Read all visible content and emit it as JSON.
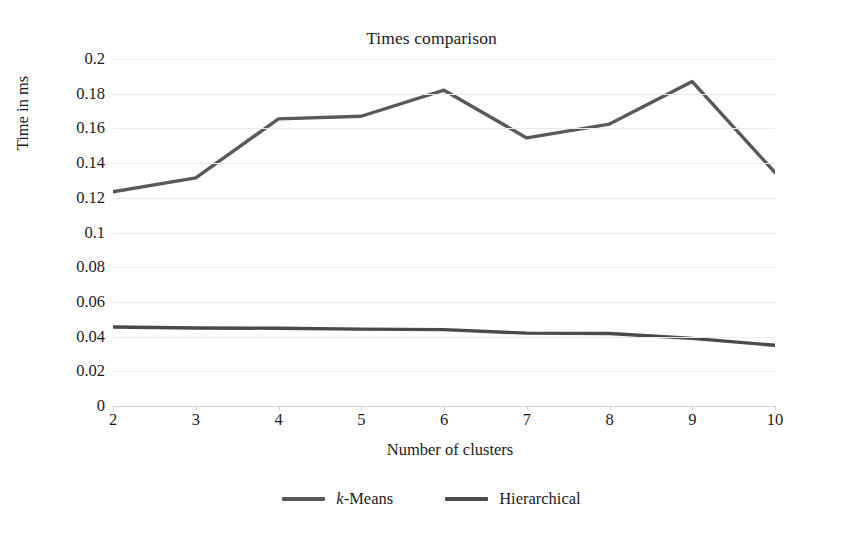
{
  "chart_data": {
    "type": "line",
    "title": "Times comparison",
    "xlabel": "Number of clusters",
    "ylabel": "Time in ms",
    "categories": [
      2,
      3,
      4,
      5,
      6,
      7,
      8,
      9,
      10
    ],
    "x_tick_labels": [
      "2",
      "3",
      "4",
      "5",
      "6",
      "7",
      "8",
      "9",
      "10"
    ],
    "y_tick_labels": [
      "0.2",
      "0.18",
      "0.16",
      "0.14",
      "0.12",
      "0.1",
      "0.08",
      "0.06",
      "0.04",
      "0.02",
      "0"
    ],
    "y_tick_values": [
      0.2,
      0.18,
      0.16,
      0.14,
      0.12,
      0.1,
      0.08,
      0.06,
      0.04,
      0.02,
      0
    ],
    "ylim": [
      0,
      0.2
    ],
    "xlim": [
      2,
      10
    ],
    "grid": true,
    "legend_position": "bottom",
    "series": [
      {
        "name": "k-Means",
        "name_italic_prefix": "k",
        "name_rest": "-Means",
        "color": "#595959",
        "values": [
          0.1235,
          0.1315,
          0.1655,
          0.167,
          0.182,
          0.1545,
          0.1625,
          0.187,
          0.1345
        ]
      },
      {
        "name": "Hierarchical",
        "color": "#4a4a4a",
        "values": [
          0.0455,
          0.045,
          0.0448,
          0.0443,
          0.044,
          0.042,
          0.0418,
          0.039,
          0.035
        ]
      }
    ]
  },
  "colors": {
    "gridline": "#e9e9e9",
    "axis": "#d2d2d2",
    "text": "#1b1b1b",
    "kmeans": "#595959",
    "hierarchical": "#4a4a4a"
  }
}
